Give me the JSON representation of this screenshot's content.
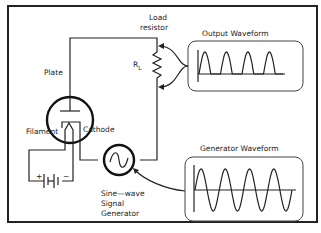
{
  "diagram": {
    "labels": {
      "load_resistor_line1": "Load",
      "load_resistor_line2": "resistor",
      "rl_main": "R",
      "rl_sub": "L",
      "plate": "Plate",
      "filament": "Filament",
      "cathode": "Cathode",
      "battery_plus": "+",
      "battery_minus": "−",
      "generator_line1": "Sine—wave",
      "generator_line2": "Signal",
      "generator_line3": "Generator"
    },
    "insets": {
      "output": {
        "title": "Output Waveform",
        "cycles": 4,
        "shape": "half-wave rectified"
      },
      "generator": {
        "title": "Generator Waveform",
        "cycles": 4,
        "shape": "sine"
      }
    }
  }
}
